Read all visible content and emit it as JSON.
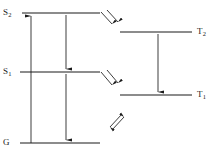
{
  "diagram": {
    "type": "energy-level-diagram",
    "background_color": "#ffffff",
    "stroke_color": "#1a1a1a",
    "text_color": "#1a1a1a",
    "labels": {
      "s2": {
        "text": "S",
        "sub": "2"
      },
      "s1": {
        "text": "S",
        "sub": "1"
      },
      "ground": {
        "text": "G",
        "sub": ""
      },
      "t2": {
        "text": "T",
        "sub": "2"
      },
      "t1": {
        "text": "T",
        "sub": "1"
      }
    },
    "levels": [
      {
        "name": "S2",
        "label": "S2",
        "side": "left",
        "y": 13,
        "x1": 22,
        "x2": 100
      },
      {
        "name": "S1",
        "label": "S1",
        "side": "left",
        "y": 72,
        "x1": 20,
        "x2": 100
      },
      {
        "name": "G",
        "label": "G",
        "side": "left",
        "y": 143,
        "x1": 20,
        "x2": 100
      },
      {
        "name": "T2",
        "label": "T2",
        "side": "right",
        "y": 32,
        "x1": 120,
        "x2": 192
      },
      {
        "name": "T1",
        "label": "T1",
        "side": "right",
        "y": 95,
        "x1": 120,
        "x2": 192
      }
    ],
    "transitions": [
      {
        "name": "absorption",
        "kind": "vertical-arrow",
        "from": "G",
        "to": "S2",
        "x": 31,
        "y1": 143,
        "y2": 15,
        "direction": "up"
      },
      {
        "name": "internal-conversion",
        "kind": "vertical-arrow",
        "from": "S2",
        "to": "S1",
        "x": 66,
        "y1": 15,
        "y2": 70,
        "direction": "down"
      },
      {
        "name": "fluorescence",
        "kind": "vertical-arrow",
        "from": "S1",
        "to": "G",
        "x": 66,
        "y1": 74,
        "y2": 141,
        "direction": "down"
      },
      {
        "name": "triplet-relaxation",
        "kind": "vertical-arrow",
        "from": "T2",
        "to": "T1",
        "x": 158,
        "y1": 34,
        "y2": 93,
        "direction": "down"
      },
      {
        "name": "intersystem-crossing-s2-t2",
        "kind": "double-diagonal-arrow",
        "from": "S2",
        "to": "T2",
        "x": 103,
        "y": 14,
        "style": "parallel-down-right"
      },
      {
        "name": "intersystem-crossing-s1-t1",
        "kind": "double-diagonal-arrow",
        "from": "S1",
        "to": "T1",
        "x": 103,
        "y": 74,
        "style": "parallel-down-right"
      },
      {
        "name": "reverse-intersystem-crossing",
        "kind": "double-diagonal-arrow",
        "from": "T1",
        "to": "G",
        "x": 112,
        "y": 118,
        "style": "antiparallel"
      }
    ]
  }
}
